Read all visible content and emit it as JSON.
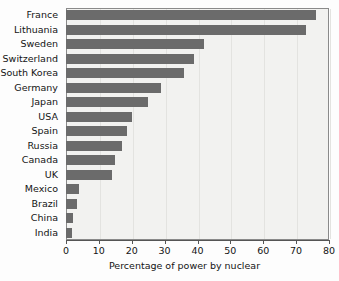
{
  "chart_data": {
    "type": "bar",
    "orientation": "horizontal",
    "title": "",
    "xlabel": "Percentage of power by nuclear",
    "ylabel": "",
    "xlim": [
      0,
      80
    ],
    "xticks": [
      0,
      10,
      20,
      30,
      40,
      50,
      60,
      70,
      80
    ],
    "grid": true,
    "legend": null,
    "bar_color": "#6b6b6b",
    "plot_background": "#f2f2f0",
    "categories": [
      "France",
      "Lithuania",
      "Sweden",
      "Switzerland",
      "South Korea",
      "Germany",
      "Japan",
      "USA",
      "Spain",
      "Russia",
      "Canada",
      "UK",
      "Mexico",
      "Brazil",
      "China",
      "India"
    ],
    "values": [
      76,
      73,
      42,
      39,
      36,
      29,
      25,
      20,
      18.5,
      17,
      15,
      14,
      4,
      3.2,
      2,
      1.8
    ]
  }
}
